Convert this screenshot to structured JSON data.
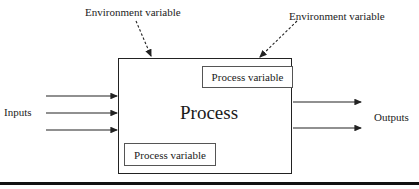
{
  "diagram": {
    "process": {
      "label": "Process"
    },
    "process_variables": [
      {
        "label": "Process variable",
        "position": "top-right"
      },
      {
        "label": "Process variable",
        "position": "bottom-left"
      }
    ],
    "environment_variables": [
      {
        "label": "Environment variable",
        "position": "top-left"
      },
      {
        "label": "Environment variable",
        "position": "top-right"
      }
    ],
    "inputs": {
      "label": "Inputs",
      "count": 3
    },
    "outputs": {
      "label": "Outputs",
      "count": 2
    },
    "colors": {
      "line": "#222222",
      "background": "#ffffff"
    }
  }
}
